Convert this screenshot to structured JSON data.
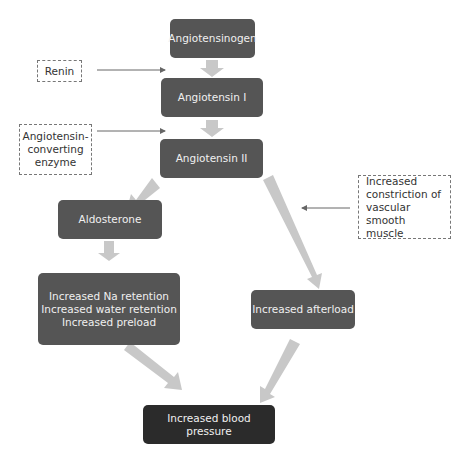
{
  "diagram": {
    "nodes": {
      "angiotensinogen": "Angiotensinogen",
      "angiotensin_1": "Angiotensin I",
      "angiotensin_2": "Angiotensin II",
      "aldosterone": "Aldosterone",
      "retention": "Increased Na retention\nIncreased water retention\nIncreased preload",
      "afterload": "Increased afterload",
      "blood_pressure": "Increased blood pressure"
    },
    "notes": {
      "renin": "Renin",
      "ace": "Angiotensin-\nconverting\nenzyme",
      "vascular": "Increased\nconstriction of\nvascular smooth\nmuscle"
    },
    "colors": {
      "node": "#555555",
      "final_node": "#2b2b2b",
      "block_arrow": "#c8c8c8",
      "line_arrow": "#666666"
    }
  }
}
